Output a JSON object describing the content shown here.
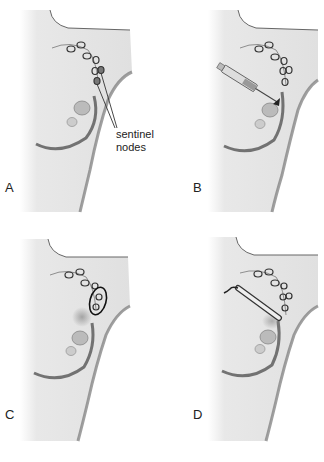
{
  "figure": {
    "colors": {
      "body": "#e6e6e6",
      "body_shadow": "#9a9a9a",
      "outline": "#555555",
      "node": "#333333",
      "background": "#ffffff"
    },
    "panels": [
      {
        "letter": "A",
        "annotation": "sentinel nodes",
        "annotation_lines": [
          "sentinel",
          "nodes"
        ],
        "content": "lymph node chain with sentinel nodes pointed out"
      },
      {
        "letter": "B",
        "annotation": "",
        "content": "syringe injecting tracer near tumor"
      },
      {
        "letter": "C",
        "annotation": "",
        "content": "sentinel nodes circled (tracer uptake)"
      },
      {
        "letter": "D",
        "annotation": "",
        "content": "probe detecting sentinel nodes"
      }
    ]
  }
}
